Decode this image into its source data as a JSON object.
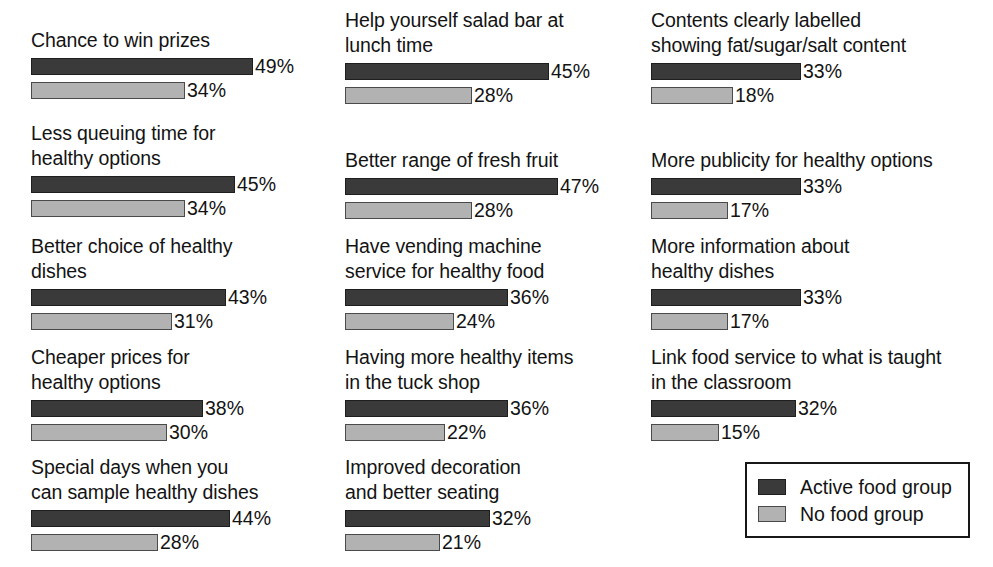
{
  "chart_data": {
    "type": "bar",
    "title": "",
    "subtitle": "",
    "xlabel": "",
    "ylabel": "",
    "orientation": "horizontal",
    "grid": false,
    "xlim": [
      0,
      50
    ],
    "value_suffix": "%",
    "legend_position": "bottom-right",
    "legend": [
      "Active food group",
      "No food group"
    ],
    "series": [
      {
        "name": "Active food group",
        "color": "#3a3a3a",
        "values": [
          49,
          45,
          43,
          38,
          44,
          45,
          47,
          36,
          36,
          32,
          33,
          33,
          33,
          32
        ]
      },
      {
        "name": "No food group",
        "color": "#b2b2b2",
        "values": [
          34,
          34,
          31,
          30,
          28,
          28,
          28,
          24,
          22,
          21,
          18,
          17,
          17,
          15
        ]
      }
    ],
    "categories": [
      "Chance to win prizes",
      "Less queuing time for healthy options",
      "Better choice of healthy dishes",
      "Cheaper prices for healthy options",
      "Special days when you can sample healthy dishes",
      "Help yourself salad bar at lunch time",
      "Better range of fresh fruit",
      "Have vending machine service for healthy food",
      "Having more healthy items in the tuck shop",
      "Improved decoration and better seating",
      "Contents clearly labelled showing fat/sugar/salt content",
      "More publicity for healthy options",
      "More information about healthy dishes",
      "Link food service to what is taught in the classroom"
    ]
  },
  "legend": {
    "rows": [
      {
        "label": "Active food group",
        "swatch": "active"
      },
      {
        "label": "No food group",
        "swatch": "nogroup"
      }
    ]
  },
  "columns": [
    {
      "items": [
        {
          "label": "Chance to win prizes",
          "top": 28,
          "bars": [
            {
              "series": "Active food group",
              "value": 49,
              "value_label": "49%",
              "width": 222
            },
            {
              "series": "No food group",
              "value": 34,
              "value_label": "34%",
              "width": 154
            }
          ]
        },
        {
          "label": "Less queuing time for\nhealthy options",
          "top": 121,
          "bars": [
            {
              "series": "Active food group",
              "value": 45,
              "value_label": "45%",
              "width": 204
            },
            {
              "series": "No food group",
              "value": 34,
              "value_label": "34%",
              "width": 154
            }
          ]
        },
        {
          "label": "Better choice of healthy\ndishes",
          "top": 234,
          "bars": [
            {
              "series": "Active food group",
              "value": 43,
              "value_label": "43%",
              "width": 195
            },
            {
              "series": "No food group",
              "value": 31,
              "value_label": "31%",
              "width": 141
            }
          ]
        },
        {
          "label": "Cheaper prices for\nhealthy options",
          "top": 345,
          "bars": [
            {
              "series": "Active food group",
              "value": 38,
              "value_label": "38%",
              "width": 172
            },
            {
              "series": "No food group",
              "value": 30,
              "value_label": "30%",
              "width": 136
            }
          ]
        },
        {
          "label": "Special days when you\ncan sample healthy dishes",
          "top": 455,
          "bars": [
            {
              "series": "Active food group",
              "value": 44,
              "value_label": "44%",
              "width": 199
            },
            {
              "series": "No food group",
              "value": 28,
              "value_label": "28%",
              "width": 127
            }
          ]
        }
      ]
    },
    {
      "items": [
        {
          "label": "Help yourself salad bar at\nlunch time",
          "top": 8,
          "bars": [
            {
              "series": "Active food group",
              "value": 45,
              "value_label": "45%",
              "width": 204
            },
            {
              "series": "No food group",
              "value": 28,
              "value_label": "28%",
              "width": 127
            }
          ]
        },
        {
          "label": "Better range of fresh fruit",
          "top": 148,
          "bars": [
            {
              "series": "Active food group",
              "value": 47,
              "value_label": "47%",
              "width": 213
            },
            {
              "series": "No food group",
              "value": 28,
              "value_label": "28%",
              "width": 127
            }
          ]
        },
        {
          "label": "Have vending machine\nservice for healthy food",
          "top": 234,
          "bars": [
            {
              "series": "Active food group",
              "value": 36,
              "value_label": "36%",
              "width": 163
            },
            {
              "series": "No food group",
              "value": 24,
              "value_label": "24%",
              "width": 109
            }
          ]
        },
        {
          "label": "Having more healthy items\nin the tuck shop",
          "top": 345,
          "bars": [
            {
              "series": "Active food group",
              "value": 36,
              "value_label": "36%",
              "width": 163
            },
            {
              "series": "No food group",
              "value": 22,
              "value_label": "22%",
              "width": 100
            }
          ]
        },
        {
          "label": "Improved decoration\nand better seating",
          "top": 455,
          "bars": [
            {
              "series": "Active food group",
              "value": 32,
              "value_label": "32%",
              "width": 145
            },
            {
              "series": "No food group",
              "value": 21,
              "value_label": "21%",
              "width": 95
            }
          ]
        }
      ]
    },
    {
      "items": [
        {
          "label": "Contents clearly labelled\nshowing fat/sugar/salt content",
          "top": 8,
          "bars": [
            {
              "series": "Active food group",
              "value": 33,
              "value_label": "33%",
              "width": 150
            },
            {
              "series": "No food group",
              "value": 18,
              "value_label": "18%",
              "width": 82
            }
          ]
        },
        {
          "label": "More publicity for healthy options",
          "top": 148,
          "bars": [
            {
              "series": "Active food group",
              "value": 33,
              "value_label": "33%",
              "width": 150
            },
            {
              "series": "No food group",
              "value": 17,
              "value_label": "17%",
              "width": 77
            }
          ]
        },
        {
          "label": "More information about\nhealthy dishes",
          "top": 234,
          "bars": [
            {
              "series": "Active food group",
              "value": 33,
              "value_label": "33%",
              "width": 150
            },
            {
              "series": "No food group",
              "value": 17,
              "value_label": "17%",
              "width": 77
            }
          ]
        },
        {
          "label": "Link food service to what is taught\nin the classroom",
          "top": 345,
          "bars": [
            {
              "series": "Active food group",
              "value": 32,
              "value_label": "32%",
              "width": 145
            },
            {
              "series": "No food group",
              "value": 15,
              "value_label": "15%",
              "width": 68
            }
          ]
        }
      ]
    }
  ]
}
